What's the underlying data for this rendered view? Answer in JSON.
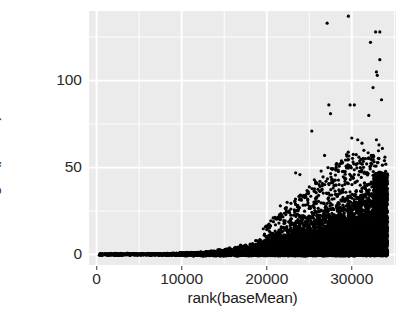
{
  "chart_data": {
    "type": "scatter",
    "title": "",
    "xlabel": "rank(baseMean)",
    "ylabel": "−log10(pvalue)",
    "xlim": [
      -900,
      35200
    ],
    "ylim": [
      -6,
      140
    ],
    "xticks": [
      0,
      10000,
      20000,
      30000
    ],
    "xtick_labels": [
      "0",
      "10000",
      "20000",
      "30000"
    ],
    "yticks": [
      0,
      50,
      100
    ],
    "ytick_labels": [
      "0",
      "50",
      "100"
    ],
    "x_minor_gridlines": [
      5000,
      15000,
      25000,
      35000
    ],
    "y_minor_gridlines": [
      25,
      75,
      125
    ],
    "grid": true,
    "legend": "none",
    "panel_background": "#ebebeb",
    "gridline_color": "#ffffff",
    "point_color": "#000000",
    "point_size": 2.1,
    "n_points_approx": 34000,
    "baseline_band": {
      "y": 0,
      "x_start": 300,
      "x_end": 34200,
      "comment": "continuous row of overlapping points along y=0"
    },
    "envelope": {
      "comment": "approximate upper boundary of the dense cluster",
      "x": [
        0,
        8000,
        12000,
        14000,
        16000,
        18000,
        20000,
        22000,
        24000,
        26000,
        28000,
        30000,
        32000,
        33500,
        34200
      ],
      "y": [
        0.4,
        0.8,
        1.4,
        2.4,
        4.0,
        6.5,
        10.0,
        14.5,
        19.0,
        23.5,
        28.0,
        33.0,
        39.0,
        45.0,
        48.0
      ]
    },
    "outliers": [
      {
        "x": 27100,
        "y": 133
      },
      {
        "x": 29600,
        "y": 137
      },
      {
        "x": 32800,
        "y": 128
      },
      {
        "x": 33300,
        "y": 128
      },
      {
        "x": 32200,
        "y": 122
      },
      {
        "x": 33300,
        "y": 112
      },
      {
        "x": 32900,
        "y": 105
      },
      {
        "x": 33000,
        "y": 103
      },
      {
        "x": 32500,
        "y": 96
      },
      {
        "x": 33500,
        "y": 89
      },
      {
        "x": 27300,
        "y": 86
      },
      {
        "x": 29800,
        "y": 86
      },
      {
        "x": 30300,
        "y": 86
      },
      {
        "x": 27500,
        "y": 81
      },
      {
        "x": 32000,
        "y": 80
      },
      {
        "x": 25300,
        "y": 71
      },
      {
        "x": 30000,
        "y": 67
      },
      {
        "x": 30700,
        "y": 66
      },
      {
        "x": 32900,
        "y": 66
      },
      {
        "x": 33200,
        "y": 63
      },
      {
        "x": 31200,
        "y": 64
      },
      {
        "x": 33600,
        "y": 61
      },
      {
        "x": 26800,
        "y": 57
      },
      {
        "x": 32300,
        "y": 57
      },
      {
        "x": 33900,
        "y": 56
      },
      {
        "x": 28900,
        "y": 53
      },
      {
        "x": 30500,
        "y": 52
      },
      {
        "x": 23400,
        "y": 47
      },
      {
        "x": 23900,
        "y": 46
      },
      {
        "x": 26400,
        "y": 48
      },
      {
        "x": 27200,
        "y": 50
      },
      {
        "x": 28100,
        "y": 49
      },
      {
        "x": 31000,
        "y": 50
      },
      {
        "x": 25600,
        "y": 43
      },
      {
        "x": 29200,
        "y": 44
      },
      {
        "x": 22400,
        "y": 30
      },
      {
        "x": 21600,
        "y": 28
      },
      {
        "x": 24900,
        "y": 36
      },
      {
        "x": 26100,
        "y": 34
      }
    ]
  },
  "axes": {
    "x": {
      "title": "rank(baseMean)",
      "ticks": [
        {
          "label": "0",
          "value": 0
        },
        {
          "label": "10000",
          "value": 10000
        },
        {
          "label": "20000",
          "value": 20000
        },
        {
          "label": "30000",
          "value": 30000
        }
      ]
    },
    "y": {
      "title": "−log10(pvalue)",
      "ticks": [
        {
          "label": "0",
          "value": 0
        },
        {
          "label": "50",
          "value": 50
        },
        {
          "label": "100",
          "value": 100
        }
      ]
    }
  }
}
